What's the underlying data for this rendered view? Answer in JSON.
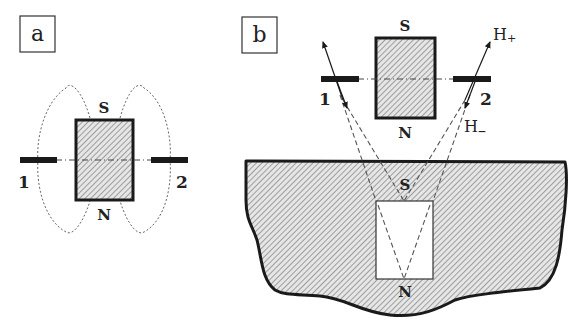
{
  "figure": {
    "panel_a": {
      "label": "a",
      "magnet_top_pole": "S",
      "magnet_bottom_pole": "N",
      "sensor_left": "1",
      "sensor_right": "2"
    },
    "panel_b": {
      "label": "b",
      "magnet_top_pole": "S",
      "magnet_bottom_pole": "N",
      "sensor_left": "1",
      "sensor_right": "2",
      "field_plus": "H",
      "field_plus_sub": "+",
      "field_minus": "H",
      "field_minus_sub": "–",
      "image_top_pole": "S",
      "image_bottom_pole": "N"
    },
    "colors": {
      "stroke": "#1a1a1a",
      "hatch": "#8a8a8a",
      "hatch_bg": "#e6e6e6",
      "dashed": "#555555"
    }
  }
}
